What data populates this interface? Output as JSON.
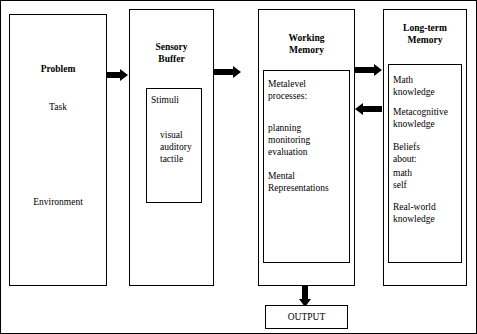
{
  "diagram": {
    "title_boxes": {
      "problem": "Problem",
      "sensory_buffer": "Sensory\nBuffer",
      "working_memory": "Working\nMemory",
      "long_term_memory": "Long-term\nMemory",
      "output": "OUTPUT"
    },
    "problem_items": [
      "Task",
      "Environment"
    ],
    "sensory_inner": {
      "header": "Stimuli",
      "items": [
        "visual",
        "auditory",
        "tactile"
      ]
    },
    "working_inner": {
      "line1": "Metalevel",
      "line2": "processes:",
      "items": [
        "planning",
        "monitoring",
        "evaluation"
      ],
      "rep_line1": "Mental",
      "rep_line2": "Representations"
    },
    "ltm_inner": {
      "groups": [
        {
          "lines": [
            "Math",
            "knowledge"
          ]
        },
        {
          "lines": [
            "Metacognitive",
            "knowledge"
          ]
        },
        {
          "lines": [
            "Beliefs",
            "about:",
            "math",
            "self"
          ]
        },
        {
          "lines": [
            "Real-world",
            "knowledge"
          ]
        }
      ]
    },
    "arrows": [
      {
        "name": "problem-to-sensory",
        "direction": "right"
      },
      {
        "name": "sensory-to-working",
        "direction": "right"
      },
      {
        "name": "working-to-ltm",
        "direction": "right"
      },
      {
        "name": "ltm-to-working",
        "direction": "left"
      },
      {
        "name": "working-to-output",
        "direction": "down"
      }
    ],
    "colors": {
      "stroke": "#000000",
      "background": "#ffffff"
    }
  }
}
